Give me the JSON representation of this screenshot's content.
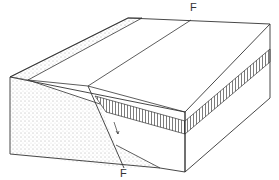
{
  "diagram": {
    "type": "block-diagram",
    "labels": {
      "fault_top": "F",
      "fault_bottom": "F"
    },
    "colors": {
      "line": "#333333",
      "background": "#ffffff",
      "stipple": "#555555"
    }
  }
}
